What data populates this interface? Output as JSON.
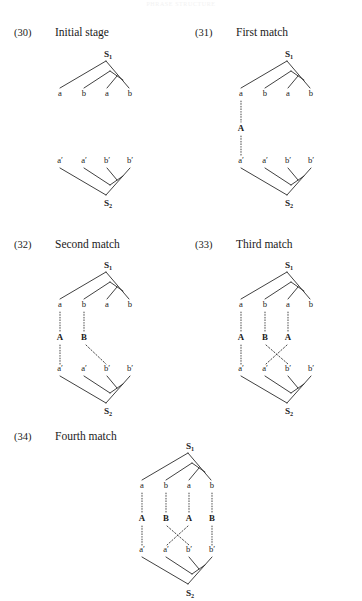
{
  "running_head": "PHRASE STRUCTURE",
  "examples": [
    {
      "num": "(30)",
      "label": "Initial stage"
    },
    {
      "num": "(31)",
      "label": "First match"
    },
    {
      "num": "(32)",
      "label": "Second match"
    },
    {
      "num": "(33)",
      "label": "Third match"
    },
    {
      "num": "(34)",
      "label": "Fourth match"
    }
  ],
  "nodes": {
    "s1": "S",
    "s1_sub": "1",
    "s2": "S",
    "s2_sub": "2",
    "a": "a",
    "b": "b",
    "a_prime": "a′",
    "b_prime": "b′",
    "A": "A",
    "B": "B"
  },
  "trees": {
    "upper_leaves": [
      "a",
      "b",
      "a",
      "b"
    ],
    "lower_leaves": [
      "a′",
      "a′",
      "b′",
      "b′"
    ],
    "upper_root": "S1",
    "lower_root": "S2"
  },
  "matches": {
    "30": {
      "mediators": [],
      "links": []
    },
    "31": {
      "mediators": [
        "A"
      ],
      "links": [
        {
          "from": "a",
          "via": "A",
          "to": "a′"
        }
      ]
    },
    "32": {
      "mediators": [
        "A",
        "B"
      ],
      "links": [
        {
          "from": "a",
          "via": "A",
          "to": "a′"
        },
        {
          "from": "b",
          "via": "B",
          "to": "b′"
        }
      ]
    },
    "33": {
      "mediators": [
        "A",
        "B",
        "A"
      ],
      "links": [
        {
          "from": "a",
          "via": "A",
          "to": "a′"
        },
        {
          "from": "b",
          "via": "B",
          "to": "b′"
        },
        {
          "from": "a",
          "via": "A",
          "to": "a′"
        }
      ],
      "crossing": true
    },
    "34": {
      "mediators": [
        "A",
        "B",
        "A",
        "B"
      ],
      "links": [
        {
          "from": "a",
          "via": "A",
          "to": "a′"
        },
        {
          "from": "b",
          "via": "B",
          "to": "b′"
        },
        {
          "from": "a",
          "via": "A",
          "to": "a′"
        },
        {
          "from": "b",
          "via": "B",
          "to": "b′"
        }
      ],
      "crossing": true
    }
  }
}
